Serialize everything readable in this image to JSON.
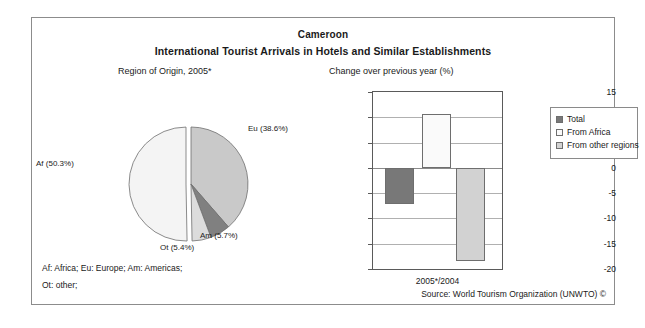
{
  "header": {
    "country": "Cameroon",
    "subtitle": "International Tourist Arrivals in Hotels and Similar Establishments"
  },
  "panels": {
    "pie_title": "Region of Origin, 2005*",
    "bar_title": "Change over previous year (%)"
  },
  "footnotes": {
    "line1": "Af: Africa; Eu: Europe; Am: Americas;",
    "line2": "Ot: other;",
    "source": "Source: World Tourism Organization (UNWTO) ©"
  },
  "colors": {
    "africa": "#f4f4f4",
    "europe": "#c9c9c9",
    "americas": "#808080",
    "other": "#dcdcdc",
    "total_bar": "#787878",
    "africa_bar": "#fafafa",
    "other_regions_bar": "#d2d2d2",
    "frame": "#8c8c8c",
    "grid": "#b0b0b0"
  },
  "chart_data": [
    {
      "type": "pie",
      "title": "Region of Origin, 2005*",
      "labels": [
        "Eu",
        "Am",
        "Ot",
        "Af"
      ],
      "display_labels": [
        "Eu (38.6%)",
        "Am (5.7%)",
        "Ot (5.4%)",
        "Af (50.3%)"
      ],
      "values": [
        38.6,
        5.7,
        5.4,
        50.3
      ],
      "units": "%",
      "start_angle_deg": 0,
      "direction": "clockwise",
      "exploded_slice": "Af",
      "legend": "none",
      "slice_colors": [
        "#c9c9c9",
        "#808080",
        "#dcdcdc",
        "#f4f4f4"
      ]
    },
    {
      "type": "bar",
      "title": "Change over previous year (%)",
      "xlabel": "",
      "ylabel": "",
      "categories": [
        "2005*/2004"
      ],
      "xtick_labels": [
        "2005*/2004"
      ],
      "ylim": [
        -20,
        15
      ],
      "yticks": [
        15,
        10,
        5,
        0,
        -5,
        -10,
        -15,
        -20
      ],
      "ytick_labels": [
        "15",
        "10",
        "5",
        "0",
        "-5",
        "-10",
        "-15",
        "-20"
      ],
      "grid": true,
      "legend_position": "right",
      "series": [
        {
          "name": "Total",
          "values": [
            -7.2
          ],
          "color": "#787878"
        },
        {
          "name": "From Africa",
          "values": [
            10.7
          ],
          "color": "#fafafa"
        },
        {
          "name": "From other regions",
          "values": [
            -18.5
          ],
          "color": "#d2d2d2"
        }
      ]
    }
  ]
}
